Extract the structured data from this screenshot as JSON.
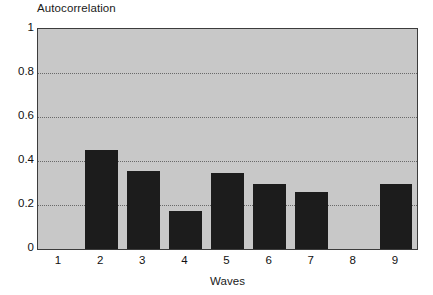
{
  "chart_data": {
    "type": "bar",
    "title": "",
    "xlabel": "Waves",
    "ylabel": "Autocorrelation",
    "categories": [
      "1",
      "2",
      "3",
      "4",
      "5",
      "6",
      "7",
      "8",
      "9"
    ],
    "values": [
      0,
      0.45,
      0.355,
      0.175,
      0.345,
      0.295,
      0.26,
      0,
      0.295
    ],
    "ylim": [
      0,
      1
    ],
    "ytick_labels": [
      "1",
      "0.8",
      "0.6",
      "0.4",
      "0.2",
      "0"
    ],
    "ytick_values": [
      1,
      0.8,
      0.6,
      0.4,
      0.2,
      0
    ],
    "gridlines": {
      "horizontal": true,
      "at": [
        0.8,
        0.6,
        0.4,
        0.2
      ],
      "style": "dotted"
    },
    "legend": null,
    "colors": {
      "bar": "#1c1c1c",
      "plot_background": "#c8c8c8",
      "figure_background": "#ffffff",
      "axis_border": "#3c3c3c",
      "gridline": "#4a4a4a",
      "text": "#111111"
    },
    "series": [
      {
        "name": "Autocorrelation",
        "values": [
          0,
          0.45,
          0.355,
          0.175,
          0.345,
          0.295,
          0.26,
          0,
          0.295
        ]
      }
    ]
  }
}
